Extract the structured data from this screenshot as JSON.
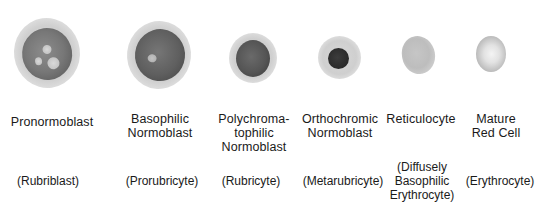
{
  "figure": {
    "stages": [
      {
        "name_line1": "Pronormoblast",
        "name_line2": "",
        "name_line3": "",
        "alt_line1": "(Rubriblast)",
        "alt_line2": "",
        "alt_line3": ""
      },
      {
        "name_line1": "Basophilic",
        "name_line2": "Normoblast",
        "name_line3": "",
        "alt_line1": "(Prorubricyte)",
        "alt_line2": "",
        "alt_line3": ""
      },
      {
        "name_line1": "Polychroma-",
        "name_line2": "tophilic",
        "name_line3": "Normoblast",
        "alt_line1": "(Rubricyte)",
        "alt_line2": "",
        "alt_line3": ""
      },
      {
        "name_line1": "Orthochromic",
        "name_line2": "Normoblast",
        "name_line3": "",
        "alt_line1": "(Metarubricyte)",
        "alt_line2": "",
        "alt_line3": ""
      },
      {
        "name_line1": "Reticulocyte",
        "name_line2": "",
        "name_line3": "",
        "alt_line1": "(Diffusely",
        "alt_line2": "Basophilic",
        "alt_line3": "Erythrocyte)"
      },
      {
        "name_line1": "Mature",
        "name_line2": "Red Cell",
        "name_line3": "",
        "alt_line1": "(Erythrocyte)",
        "alt_line2": "",
        "alt_line3": ""
      }
    ]
  },
  "colors": {
    "background": "#ffffff",
    "text": "#1a1a1a",
    "cytoplasm": "#d4d4d4",
    "nucleus_dark": "#3a3a3a",
    "nucleus_medium": "#6e6e6e"
  }
}
